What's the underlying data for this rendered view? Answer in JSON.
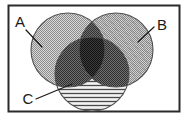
{
  "figure": {
    "background_color": "#ffffff",
    "frame": {
      "stroke_color": "#2b2b2b",
      "fill_color": "#ffffff",
      "x": 8,
      "y": 5,
      "width": 172,
      "height": 107
    }
  },
  "labels": {
    "a": "A",
    "b": "B",
    "c": "C"
  },
  "label_positions": {
    "a": {
      "x": 20,
      "y": 27
    },
    "b": {
      "x": 158,
      "y": 30
    },
    "c": {
      "x": 28,
      "y": 103
    }
  },
  "leader_lines": {
    "a": {
      "x1": 26,
      "y1": 30,
      "x2": 42,
      "y2": 47
    },
    "b": {
      "x1": 154,
      "y1": 27,
      "x2": 138,
      "y2": 42
    },
    "c": {
      "x1": 36,
      "y1": 99,
      "x2": 72,
      "y2": 84
    }
  },
  "circles": [
    {
      "id": "A",
      "label": "A",
      "cx": 68,
      "cy": 50,
      "r": 37,
      "fill_pattern": "fine-stipple",
      "fill_color": "#b4b4b4",
      "stroke_color": "#555555"
    },
    {
      "id": "B",
      "label": "B",
      "cx": 116,
      "cy": 50,
      "r": 37,
      "fill_pattern": "diagonal-hatch-stipple",
      "fill_color": "#a8a8a8",
      "stroke_color": "#555555"
    },
    {
      "id": "C",
      "label": "C",
      "cx": 92,
      "cy": 74,
      "r": 37,
      "fill_pattern": "horizontal-lines",
      "fill_color": "#c8c8c8",
      "stroke_color": "#555555"
    }
  ],
  "regions": [
    {
      "id": "A-only",
      "shading": "fine-stipple",
      "tone": "#b4b4b4"
    },
    {
      "id": "B-only",
      "shading": "diagonal-hatch",
      "tone": "#a8a8a8"
    },
    {
      "id": "C-only",
      "shading": "horizontal-lines",
      "tone": "#d2d2d2"
    },
    {
      "id": "A-and-B",
      "shading": "cross-hatch",
      "tone": "#6e6e6e"
    },
    {
      "id": "A-and-C",
      "shading": "cross-hatch",
      "tone": "#5e5e5e"
    },
    {
      "id": "B-and-C",
      "shading": "cross-hatch",
      "tone": "#5e5e5e"
    },
    {
      "id": "A-and-B-and-C",
      "shading": "dense-cross-hatch",
      "tone": "#3a3a3a"
    }
  ],
  "colors": {
    "ink": "#1a1a1a",
    "frame": "#2b2b2b",
    "outline": "#555555",
    "paper": "#ffffff"
  }
}
